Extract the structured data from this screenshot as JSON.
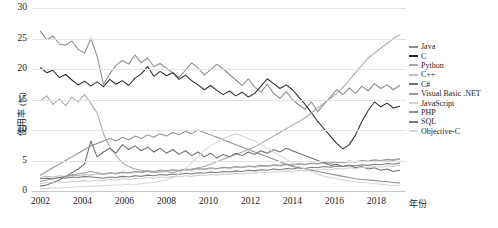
{
  "chart_data": {
    "type": "line",
    "title": "",
    "xlabel": "年份",
    "ylabel": "使用率 (%)",
    "xlim": [
      2001.6,
      2019.4
    ],
    "ylim": [
      0,
      30
    ],
    "grid": true,
    "legend_position": "right",
    "y_ticks": [
      "0",
      "5",
      "10",
      "15",
      "20",
      "25",
      "30"
    ],
    "y_tick_values": [
      0,
      5,
      10,
      15,
      20,
      25,
      30
    ],
    "x_ticks": [
      "2002",
      "2004",
      "2006",
      "2008",
      "2010",
      "2012",
      "2014",
      "2016",
      "2018"
    ],
    "x_tick_values": [
      2002,
      2004,
      2006,
      2008,
      2010,
      2012,
      2014,
      2016,
      2018
    ],
    "x": [
      2002.0,
      2002.3,
      2002.6,
      2002.9,
      2003.2,
      2003.5,
      2003.8,
      2004.1,
      2004.4,
      2004.7,
      2005.0,
      2005.3,
      2005.6,
      2005.9,
      2006.2,
      2006.5,
      2006.8,
      2007.1,
      2007.4,
      2007.7,
      2008.0,
      2008.3,
      2008.6,
      2008.9,
      2009.2,
      2009.5,
      2009.8,
      2010.1,
      2010.4,
      2010.7,
      2011.0,
      2011.3,
      2011.6,
      2011.9,
      2012.2,
      2012.5,
      2012.8,
      2013.1,
      2013.4,
      2013.7,
      2014.0,
      2014.3,
      2014.6,
      2014.9,
      2015.2,
      2015.5,
      2015.8,
      2016.1,
      2016.4,
      2016.7,
      2017.0,
      2017.3,
      2017.6,
      2017.9,
      2018.2,
      2018.5,
      2018.8,
      2019.1
    ],
    "series": [
      {
        "name": "Java",
        "color": "#8c8c8c",
        "values": [
          26.2,
          24.8,
          25.4,
          24.1,
          23.9,
          24.6,
          23.2,
          22.6,
          25.0,
          22.1,
          17.5,
          19.2,
          20.6,
          21.4,
          20.8,
          22.3,
          21.0,
          21.8,
          20.4,
          20.9,
          20.1,
          19.4,
          18.6,
          19.8,
          21.0,
          20.2,
          19.0,
          19.9,
          20.8,
          20.0,
          19.1,
          18.2,
          17.3,
          18.4,
          17.0,
          16.2,
          17.5,
          16.0,
          15.2,
          16.3,
          15.0,
          14.1,
          13.4,
          14.6,
          13.0,
          14.2,
          15.4,
          16.6,
          15.8,
          16.9,
          16.0,
          17.2,
          16.4,
          17.6,
          16.8,
          17.4,
          16.6,
          17.3
        ]
      },
      {
        "name": "C",
        "color": "#2b2b2b",
        "values": [
          20.2,
          19.4,
          19.8,
          18.6,
          19.1,
          18.2,
          17.4,
          18.0,
          17.2,
          17.9,
          17.1,
          18.3,
          17.5,
          18.1,
          17.3,
          18.5,
          19.2,
          20.4,
          18.8,
          19.6,
          18.9,
          19.4,
          18.3,
          19.0,
          18.1,
          17.4,
          16.6,
          17.3,
          16.5,
          15.8,
          16.4,
          15.6,
          16.2,
          15.4,
          16.0,
          17.2,
          18.4,
          17.6,
          16.8,
          17.4,
          16.6,
          15.4,
          14.2,
          12.8,
          11.4,
          10.2,
          9.0,
          7.8,
          6.9,
          7.6,
          9.2,
          11.4,
          13.2,
          14.6,
          13.8,
          14.4,
          13.6,
          13.9
        ]
      },
      {
        "name": "Python",
        "color": "#a8a8a8",
        "values": [
          14.8,
          15.6,
          14.2,
          15.1,
          14.0,
          15.4,
          14.6,
          15.8,
          14.4,
          12.8,
          9.4,
          7.2,
          5.8,
          4.6,
          4.0,
          3.6,
          3.4,
          3.2,
          3.0,
          3.1,
          3.2,
          3.0,
          3.3,
          3.4,
          3.6,
          3.8,
          4.0,
          4.4,
          4.8,
          5.2,
          5.6,
          6.0,
          6.4,
          6.8,
          7.2,
          7.8,
          8.4,
          9.0,
          9.6,
          10.2,
          10.8,
          11.4,
          12.0,
          12.8,
          13.6,
          14.4,
          15.2,
          16.0,
          17.0,
          18.2,
          19.4,
          20.6,
          21.8,
          22.6,
          23.4,
          24.2,
          25.0,
          25.6
        ]
      },
      {
        "name": "C++",
        "color": "#bdbdbd",
        "values": [
          2.2,
          2.4,
          2.3,
          2.5,
          2.4,
          2.6,
          2.5,
          2.7,
          2.6,
          2.8,
          2.7,
          2.9,
          2.8,
          3.0,
          2.9,
          3.1,
          3.0,
          3.2,
          3.1,
          3.3,
          3.2,
          3.4,
          3.3,
          3.5,
          3.4,
          3.6,
          3.5,
          3.7,
          3.6,
          3.8,
          3.7,
          3.9,
          3.8,
          4.0,
          3.9,
          4.1,
          4.0,
          4.2,
          4.1,
          4.3,
          4.2,
          4.4,
          4.3,
          4.5,
          4.4,
          4.6,
          4.5,
          4.7,
          4.6,
          4.8,
          4.7,
          4.9,
          4.8,
          5.0,
          4.9,
          5.1,
          5.0,
          5.2
        ]
      },
      {
        "name": "C#",
        "color": "#6e6e6e",
        "values": [
          0.8,
          1.0,
          1.4,
          1.8,
          2.4,
          3.0,
          3.6,
          4.4,
          8.2,
          5.6,
          6.4,
          7.0,
          6.2,
          7.6,
          6.8,
          7.4,
          6.6,
          7.2,
          6.4,
          7.0,
          6.2,
          6.8,
          6.0,
          6.6,
          5.8,
          6.4,
          5.6,
          6.2,
          5.4,
          6.0,
          5.6,
          6.2,
          5.8,
          6.4,
          6.0,
          6.6,
          6.2,
          6.8,
          6.4,
          7.0,
          6.6,
          6.2,
          5.8,
          5.4,
          5.0,
          4.6,
          4.2,
          4.4,
          4.0,
          4.2,
          3.8,
          4.0,
          3.6,
          3.8,
          3.4,
          3.6,
          3.2,
          3.4
        ]
      },
      {
        "name": "Visual Basic .NET",
        "color": "#9a9a9a",
        "values": [
          1.6,
          1.8,
          2.0,
          2.2,
          2.4,
          2.6,
          2.8,
          3.0,
          3.2,
          3.0,
          2.8,
          3.0,
          2.9,
          3.1,
          3.0,
          3.2,
          3.1,
          3.3,
          3.2,
          3.4,
          3.3,
          3.5,
          3.4,
          3.6,
          3.5,
          3.7,
          3.6,
          3.8,
          3.7,
          3.9,
          3.8,
          4.0,
          3.9,
          4.1,
          4.0,
          4.2,
          4.1,
          4.3,
          4.2,
          4.4,
          4.3,
          4.5,
          4.4,
          4.6,
          4.5,
          4.7,
          4.6,
          4.8,
          4.7,
          4.9,
          4.8,
          5.0,
          4.9,
          5.1,
          5.0,
          5.2,
          5.1,
          5.3
        ]
      },
      {
        "name": "JavaScript",
        "color": "#cfcfcf",
        "values": [
          1.2,
          1.4,
          1.3,
          1.5,
          1.4,
          1.6,
          1.5,
          1.7,
          1.6,
          1.8,
          1.7,
          1.9,
          1.8,
          2.0,
          1.9,
          2.1,
          2.0,
          2.2,
          2.1,
          2.3,
          2.2,
          2.4,
          2.3,
          2.5,
          2.4,
          2.6,
          2.5,
          2.7,
          2.6,
          2.8,
          2.7,
          2.9,
          2.8,
          3.0,
          2.9,
          3.1,
          3.0,
          3.2,
          3.1,
          3.3,
          3.2,
          3.4,
          3.3,
          3.5,
          3.4,
          3.6,
          3.5,
          3.7,
          3.6,
          3.8,
          3.7,
          3.9,
          3.8,
          4.0,
          3.9,
          4.1,
          4.0,
          4.2
        ]
      },
      {
        "name": "PHP",
        "color": "#8f8f8f",
        "values": [
          2.6,
          3.2,
          3.8,
          4.4,
          5.0,
          5.6,
          6.2,
          6.8,
          7.4,
          7.8,
          8.2,
          8.6,
          8.2,
          8.8,
          8.4,
          9.0,
          8.6,
          9.2,
          8.8,
          9.4,
          9.0,
          9.6,
          9.2,
          9.8,
          9.4,
          10.0,
          9.6,
          9.2,
          8.8,
          8.4,
          8.0,
          7.6,
          7.2,
          6.8,
          6.4,
          6.0,
          5.6,
          5.2,
          4.8,
          4.4,
          4.0,
          3.8,
          3.6,
          3.4,
          3.2,
          3.0,
          2.8,
          2.6,
          2.4,
          2.2,
          2.0,
          1.9,
          1.8,
          1.7,
          1.6,
          1.5,
          1.4,
          1.3
        ]
      },
      {
        "name": "SQL",
        "color": "#7a7a7a",
        "values": [
          2.0,
          2.1,
          2.0,
          2.2,
          2.1,
          2.3,
          2.2,
          2.4,
          2.3,
          2.2,
          2.1,
          2.3,
          2.2,
          2.4,
          2.3,
          2.5,
          2.4,
          2.6,
          2.5,
          2.7,
          2.6,
          2.8,
          2.7,
          2.9,
          2.8,
          3.0,
          2.9,
          3.1,
          3.0,
          3.2,
          3.1,
          3.3,
          3.2,
          3.4,
          3.3,
          3.5,
          3.4,
          3.6,
          3.5,
          3.7,
          3.6,
          3.8,
          3.7,
          3.9,
          3.8,
          4.0,
          3.9,
          4.1,
          4.0,
          4.2,
          4.1,
          4.3,
          4.2,
          4.4,
          4.3,
          4.5,
          4.4,
          4.6
        ]
      },
      {
        "name": "Objective-C",
        "color": "#d6d6d6",
        "values": [
          0.4,
          0.4,
          0.5,
          0.5,
          0.6,
          0.6,
          0.7,
          0.7,
          0.8,
          0.8,
          0.9,
          0.9,
          1.0,
          1.0,
          1.1,
          1.1,
          1.2,
          1.3,
          1.4,
          1.6,
          1.8,
          2.2,
          2.8,
          3.6,
          4.6,
          5.6,
          6.6,
          7.4,
          8.0,
          8.6,
          9.0,
          9.4,
          9.0,
          8.6,
          8.2,
          7.6,
          7.0,
          6.4,
          5.8,
          5.2,
          4.6,
          4.0,
          3.6,
          3.2,
          2.8,
          2.4,
          2.2,
          2.0,
          1.8,
          1.6,
          1.5,
          1.4,
          1.3,
          1.2,
          1.1,
          1.0,
          0.9,
          0.9
        ]
      }
    ]
  }
}
